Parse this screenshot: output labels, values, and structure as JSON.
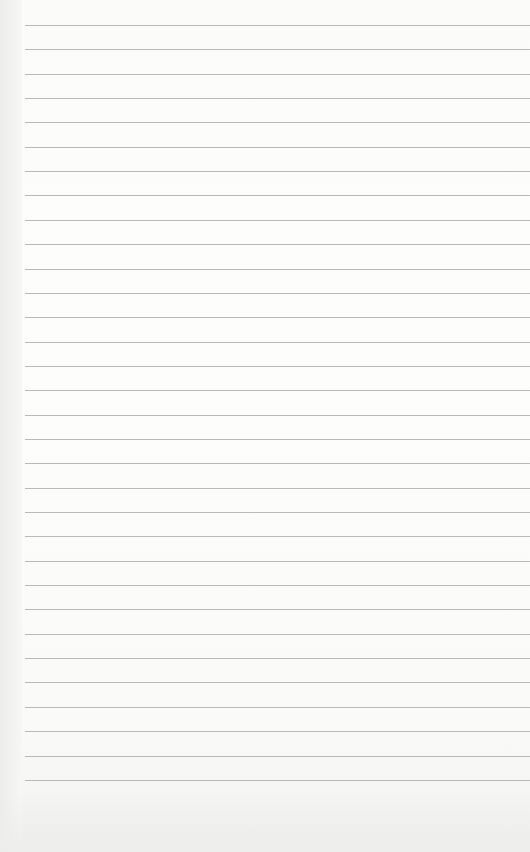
{
  "page": {
    "type": "blank lined notepad paper",
    "line_count": 32,
    "first_line_y": 25,
    "line_spacing": 24.35,
    "line_left": 25,
    "colors": {
      "paper": "#fcfcfb",
      "rule": "#b9b9b7",
      "edge_shadow": "#ececea"
    }
  }
}
